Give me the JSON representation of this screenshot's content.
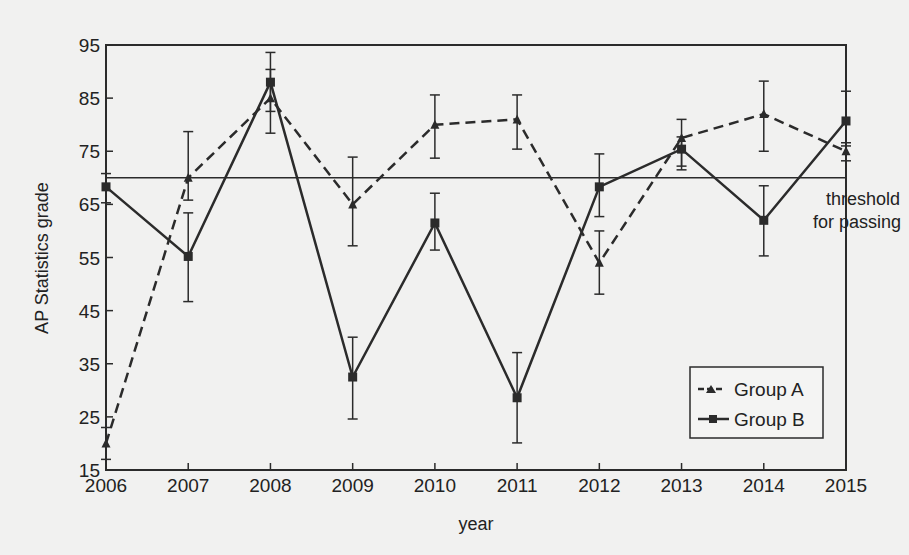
{
  "chart_data": {
    "type": "line",
    "title": "",
    "xlabel": "year",
    "ylabel": "AP Statistics grade",
    "x": [
      2006,
      2007,
      2008,
      2009,
      2010,
      2011,
      2012,
      2013,
      2014,
      2015
    ],
    "xticks": [
      "2006",
      "2007",
      "2008",
      "2009",
      "2010",
      "2011",
      "2012",
      "2013",
      "2014",
      "2015"
    ],
    "yticks": [
      15,
      25,
      35,
      45,
      55,
      65,
      75,
      85,
      95
    ],
    "ylim": [
      15,
      95
    ],
    "xlim": [
      2006,
      2015
    ],
    "grid": false,
    "legend_position": "lower right",
    "error_bars": true,
    "series": [
      {
        "name": "Group A",
        "line_style": "dashed",
        "marker": "triangle",
        "values": [
          20,
          70,
          85,
          65,
          80,
          81,
          54,
          77.5,
          82,
          75
        ],
        "error_low": [
          17,
          65.8,
          78.4,
          57.2,
          73.7,
          75.4,
          48.1,
          72.2,
          75,
          73.2
        ],
        "error_high": [
          23,
          78.7,
          90.4,
          73.9,
          85.6,
          85.6,
          60,
          81,
          88.2,
          76.6
        ]
      },
      {
        "name": "Group B",
        "line_style": "solid",
        "marker": "square",
        "values": [
          68.3,
          55.2,
          88,
          32.5,
          61.5,
          28.6,
          68.3,
          75.4,
          62,
          80.7
        ],
        "error_low": [
          65.3,
          46.7,
          82.5,
          24.6,
          56.4,
          20.1,
          62.7,
          71.5,
          55.3,
          76
        ],
        "error_high": [
          70.8,
          63.4,
          93.6,
          40,
          67.1,
          37.1,
          74.5,
          77.7,
          68.5,
          86.3
        ]
      }
    ],
    "annotations": [
      {
        "type": "hline",
        "y": 70,
        "label": "threshold for passing",
        "label_lines": [
          "threshold",
          "for passing"
        ]
      }
    ]
  },
  "labels": {
    "xlabel": "year",
    "ylabel": "AP Statistics grade",
    "threshold_line1": "threshold",
    "threshold_line2": "for passing",
    "legend_a": "Group A",
    "legend_b": "Group B"
  },
  "colors": {
    "background": "#f1f1f0",
    "ink": "#2b2b2b"
  }
}
